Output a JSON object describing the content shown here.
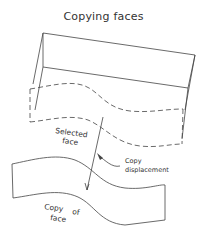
{
  "title": "Copying faces",
  "labels": {
    "selected_face_line1": "Selected",
    "selected_face_line2": "face",
    "copy_displacement_line1": "Copy",
    "copy_displacement_line2": "displacement",
    "copy_of_face_line1": "Copy",
    "copy_of_face_line2": "of",
    "copy_of_face_line3": "face"
  },
  "colors": {
    "line": "#444444",
    "text": "#333333",
    "background": "#ffffff"
  }
}
